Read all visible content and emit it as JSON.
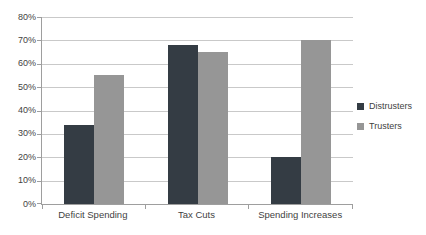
{
  "chart_data": {
    "type": "bar",
    "categories": [
      "Deficit Spending",
      "Tax Cuts",
      "Spending Increases"
    ],
    "series": [
      {
        "name": "Distrusters",
        "color": "#343c44",
        "values": [
          34,
          68,
          20
        ]
      },
      {
        "name": "Trusters",
        "color": "#969696",
        "values": [
          55,
          65,
          70
        ]
      }
    ],
    "title": "",
    "xlabel": "",
    "ylabel": "",
    "ylim": [
      0,
      80
    ],
    "ytick_step": 10,
    "ytick_labels": [
      "0%",
      "10%",
      "20%",
      "30%",
      "40%",
      "50%",
      "60%",
      "70%",
      "80%"
    ],
    "grid": true,
    "legend_position": "right"
  },
  "colors": {
    "background": "#ffffff",
    "gridline": "#c9c9c9",
    "axis": "#9e9e9e",
    "text": "#3f3f3f"
  }
}
